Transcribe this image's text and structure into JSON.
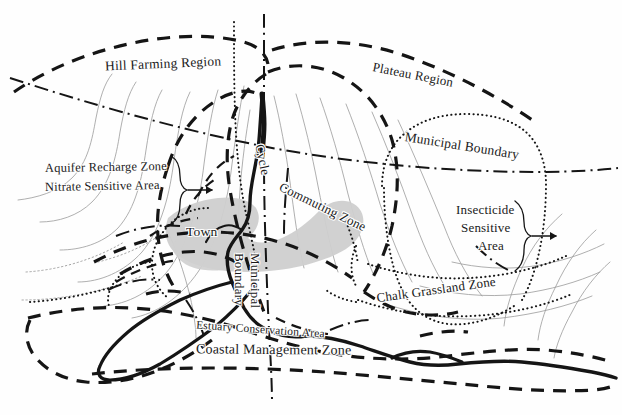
{
  "map": {
    "title": "Land-use and Environmental Designation Map",
    "background_color": "#fefefe",
    "ink_color": "#151515",
    "contour_color": "#8d8d8d",
    "town_fill_color": "#cfcfcf",
    "labels": {
      "hill_farming_region": "Hill Farming Region",
      "plateau_region": "Plateau Region",
      "aquifer_recharge_zone": "Aquifer Recharge Zone",
      "nitrate_sensitive_area": "Nitrate Sensitive Area",
      "municipal_boundary_right": "Municipal Boundary",
      "municipal_boundary_vertical_word1": "Municipal",
      "municipal_boundary_vertical_word2": "Boundary",
      "cycle": "Cycle",
      "commuting_zone": "Commuting Zone",
      "town": "Town",
      "insecticide": "Insecticide",
      "sensitive": "Sensitive",
      "area": "Area",
      "chalk_grassland_zone": "Chalk Grassland Zone",
      "estuary_conservation_area": "Estuary Conservation Area",
      "coastal_management_zone": "Coastal Management Zone"
    },
    "line_styles": {
      "heavy_dashed": "Zone boundary (heavy dashed)",
      "dash_dot": "Municipal boundary (dash-dot)",
      "dotted": "Designated sensitive area (dotted)",
      "thin_solid": "Contour line (thin solid)",
      "heavy_solid": "Coastline / river (heavy solid)"
    }
  }
}
